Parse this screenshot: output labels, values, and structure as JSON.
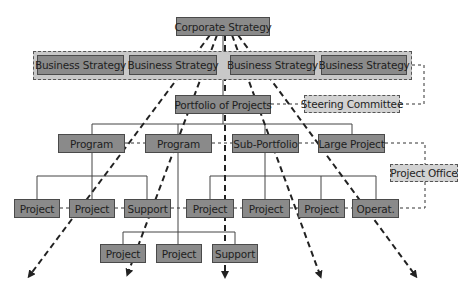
{
  "diagram": {
    "type": "org-hierarchy",
    "colors": {
      "node_fill": "#8a8a8a",
      "node_border": "#4a4a4a",
      "band_fill": "#c8c8c8",
      "support_fill": "#d2d2d2",
      "line": "#333333"
    },
    "level0": {
      "corporate": "Corporate Strategy"
    },
    "level1": {
      "business": [
        "Business Strategy",
        "Business Strategy",
        "Business Strategy",
        "Business Strategy"
      ]
    },
    "level2": {
      "portfolio": "Portfolio of Projects",
      "steering": "Steering Committee"
    },
    "level3": {
      "items": [
        "Program",
        "Program",
        "Sub-Portfolio",
        "Large Project"
      ],
      "project_office": "Project Office"
    },
    "level4": {
      "items": [
        "Project",
        "Project",
        "Support",
        "Project",
        "Project",
        "Project",
        "Operat."
      ]
    },
    "level5": {
      "items": [
        "Project",
        "Project",
        "Support"
      ]
    }
  }
}
